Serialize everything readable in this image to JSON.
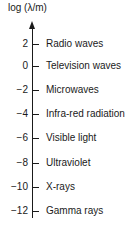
{
  "diagram": {
    "axis_title": "log (λ/m)",
    "ticks": [
      {
        "value": "2",
        "label": "Radio waves"
      },
      {
        "value": "0",
        "label": "Television waves"
      },
      {
        "value": "−2",
        "label": "Microwaves"
      },
      {
        "value": "−4",
        "label": "Infra-red radiation"
      },
      {
        "value": "−6",
        "label": "Visible light"
      },
      {
        "value": "−8",
        "label": "Ultraviolet"
      },
      {
        "value": "−10",
        "label": "X-rays"
      },
      {
        "value": "−12",
        "label": "Gamma rays"
      }
    ],
    "colors": {
      "ink": "#1a1a1a",
      "background": "#ffffff"
    }
  }
}
